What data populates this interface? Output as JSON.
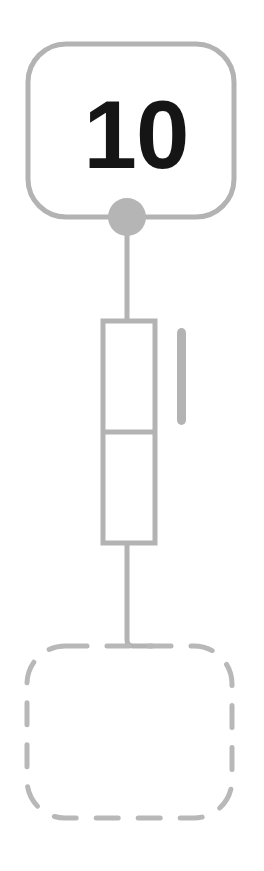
{
  "canvas": {
    "width": 264,
    "height": 871,
    "background": "#ffffff"
  },
  "palette": {
    "stroke_gray": "#b3b3b3",
    "stroke_gray_dark": "#a8a8a8",
    "label_black": "#151515",
    "dashed_gray": "#b8b8b8",
    "connector_dot": "#b5b5b5"
  },
  "diagram": {
    "type": "flow-node-chain",
    "nodes": [
      {
        "id": "top-card",
        "kind": "rounded-rectangle",
        "style": "solid",
        "label": "10",
        "label_color": "#151515",
        "label_font_size": 96,
        "stroke": "#b3b3b3",
        "stroke_width": 5,
        "fill": "none",
        "x": 28,
        "y": 44,
        "width": 206,
        "height": 173,
        "corner_radius": 38
      },
      {
        "id": "stacked-cells",
        "kind": "split-rectangle",
        "style": "solid",
        "stroke": "#b3b3b3",
        "stroke_width": 5,
        "fill": "none",
        "x": 103,
        "y": 321,
        "width": 52,
        "height": 222,
        "divider_y": 432,
        "cells": 2
      },
      {
        "id": "side-bar",
        "kind": "rounded-bar",
        "style": "solid",
        "stroke": "#b3b3b3",
        "fill": "#b3b3b3",
        "x": 177,
        "y": 328,
        "width": 9,
        "height": 97,
        "corner_radius": 5
      },
      {
        "id": "bottom-placeholder",
        "kind": "rounded-rectangle",
        "style": "dashed",
        "label": "",
        "stroke": "#b8b8b8",
        "stroke_width": 5,
        "dash_pattern": "22 20",
        "fill": "none",
        "x": 27,
        "y": 646,
        "width": 205,
        "height": 172,
        "corner_radius": 38
      }
    ],
    "connectors": [
      {
        "id": "dot-on-top-card",
        "kind": "filled-circle",
        "cx": 127,
        "cy": 217,
        "r": 19,
        "fill": "#b5b5b5"
      },
      {
        "id": "link-card-to-cells",
        "kind": "line",
        "stroke": "#b3b3b3",
        "stroke_width": 5,
        "from_x": 127,
        "from_y": 217,
        "to_x": 127,
        "to_y": 321
      },
      {
        "id": "link-cells-to-placeholder",
        "kind": "elbow",
        "stroke": "#b3b3b3",
        "stroke_width": 5,
        "from_x": 127,
        "from_y": 543,
        "corner_x": 127,
        "corner_y": 646,
        "to_x": 152,
        "to_y": 646
      }
    ]
  }
}
